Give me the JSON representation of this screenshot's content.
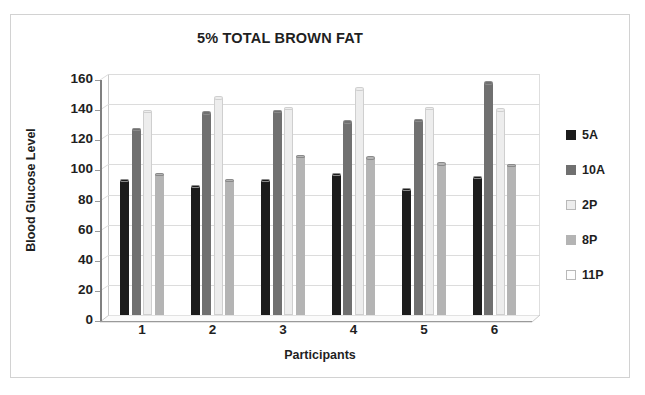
{
  "chart_data": {
    "type": "bar",
    "title": "5% TOTAL BROWN FAT",
    "xlabel": "Participants",
    "ylabel": "Blood Glucose Level",
    "categories": [
      "1",
      "2",
      "3",
      "4",
      "5",
      "6"
    ],
    "yticks": [
      0,
      20,
      40,
      60,
      80,
      100,
      120,
      140,
      160
    ],
    "ylim": [
      0,
      160
    ],
    "grid": true,
    "legend_position": "right",
    "style": "3d-clustered-column",
    "series": [
      {
        "name": "5A",
        "color": "#1c1c1c",
        "values": [
          89,
          85,
          89,
          93,
          83,
          91
        ]
      },
      {
        "name": "10A",
        "color": "#707070",
        "values": [
          123,
          134,
          135,
          128,
          129,
          154
        ]
      },
      {
        "name": "2P",
        "color": "#ededed",
        "values": [
          135,
          144,
          137,
          150,
          137,
          136
        ]
      },
      {
        "name": "8P",
        "color": "#b4b4b4",
        "values": [
          93,
          89,
          105,
          104,
          100,
          99
        ]
      },
      {
        "name": "11P",
        "color": "#fdfdfd",
        "values": [
          null,
          null,
          null,
          null,
          null,
          null
        ]
      }
    ]
  },
  "legend": {
    "items": [
      {
        "label": "5A",
        "color": "#1c1c1c"
      },
      {
        "label": "10A",
        "color": "#707070"
      },
      {
        "label": "2P",
        "color": "#ededed"
      },
      {
        "label": "8P",
        "color": "#b4b4b4"
      },
      {
        "label": "11P",
        "color": "#fdfdfd"
      }
    ]
  }
}
